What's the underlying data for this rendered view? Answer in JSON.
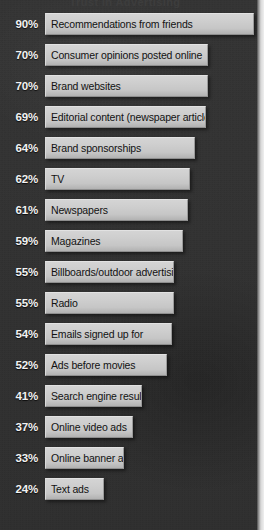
{
  "chart": {
    "title": "Trust in Advertising",
    "axis_max": 90
  },
  "chart_data": {
    "type": "bar",
    "title": "Trust in Advertising",
    "xlabel": "",
    "ylabel": "",
    "xlim": [
      0,
      90
    ],
    "grid": false,
    "legend": "none",
    "orientation": "horizontal",
    "value_suffix": "%",
    "categories": [
      "Recommendations from friends",
      "Consumer opinions posted online",
      "Brand websites",
      "Editorial content (newspaper article)",
      "Brand sponsorships",
      "TV",
      "Newspapers",
      "Magazines",
      "Billboards/outdoor advertising",
      "Radio",
      "Emails signed up for",
      "Ads before movies",
      "Search engine result ads",
      "Online video ads",
      "Online banner ads",
      "Text ads"
    ],
    "values": [
      90,
      70,
      70,
      69,
      64,
      62,
      61,
      59,
      55,
      55,
      54,
      52,
      41,
      37,
      33,
      24
    ]
  },
  "rows": [
    {
      "pct": "90%",
      "value": 90,
      "label": "Recommendations from friends"
    },
    {
      "pct": "70%",
      "value": 70,
      "label": "Consumer opinions posted online"
    },
    {
      "pct": "70%",
      "value": 70,
      "label": "Brand websites"
    },
    {
      "pct": "69%",
      "value": 69,
      "label": "Editorial content (newspaper article)"
    },
    {
      "pct": "64%",
      "value": 64,
      "label": "Brand sponsorships"
    },
    {
      "pct": "62%",
      "value": 62,
      "label": "TV"
    },
    {
      "pct": "61%",
      "value": 61,
      "label": "Newspapers"
    },
    {
      "pct": "59%",
      "value": 59,
      "label": "Magazines"
    },
    {
      "pct": "55%",
      "value": 55,
      "label": "Billboards/outdoor advertising"
    },
    {
      "pct": "55%",
      "value": 55,
      "label": "Radio"
    },
    {
      "pct": "54%",
      "value": 54,
      "label": "Emails signed up for"
    },
    {
      "pct": "52%",
      "value": 52,
      "label": "Ads before movies"
    },
    {
      "pct": "41%",
      "value": 41,
      "label": "Search engine result ads"
    },
    {
      "pct": "37%",
      "value": 37,
      "label": "Online video ads"
    },
    {
      "pct": "33%",
      "value": 33,
      "label": "Online banner ads"
    },
    {
      "pct": "24%",
      "value": 24,
      "label": "Text ads"
    }
  ],
  "colors": {
    "background": "#333333",
    "bar": "#c9c9c9",
    "bar_text": "#121212",
    "pct_text": "#f2f2f2"
  }
}
